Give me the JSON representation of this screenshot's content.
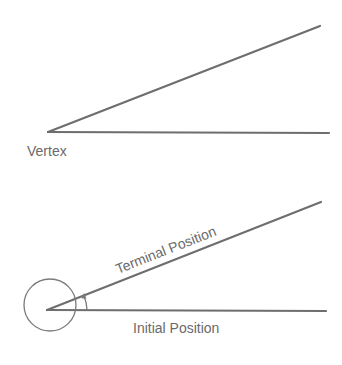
{
  "diagram": {
    "stroke_color": "#6e6e6e",
    "text_color": "#6a6a6a",
    "top": {
      "vertex_label": "Vertex",
      "vertex": [
        48,
        132
      ],
      "ray_upper_end": [
        320,
        26
      ],
      "ray_lower_end": [
        329,
        133
      ]
    },
    "bottom": {
      "terminal_label": "Terminal Position",
      "initial_label": "Initial Position",
      "vertex": [
        47,
        310
      ],
      "terminal_ray_end": [
        321,
        202
      ],
      "initial_ray_end": [
        326,
        311
      ],
      "rotation_circle": {
        "cx": 50,
        "cy": 305,
        "r": 26
      },
      "angle_arc_arrow": "counterclockwise arrow from initial to terminal side"
    }
  }
}
